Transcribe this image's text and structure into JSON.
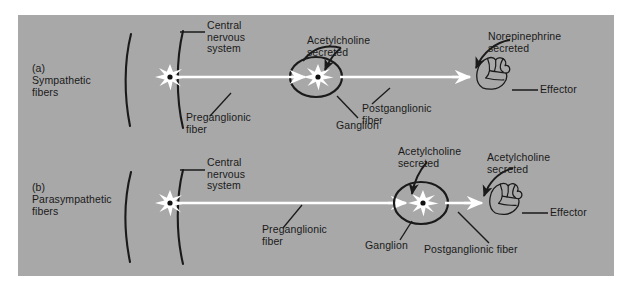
{
  "figure": {
    "background_color": "#ffffff",
    "panel_color": "#a8a8a8",
    "ink_color": "#1a1a1a",
    "fiber_color": "#ffffff"
  },
  "panels": [
    {
      "id": "a",
      "caption": "(a)\nSympathetic\nfibers",
      "caption_marker": "(a)",
      "caption_text": "Sympathetic\nfibers",
      "labels": {
        "cns": "Central\nnervous\nsystem",
        "preganglionic": "Preganglionic\nfiber",
        "ganglion": "Ganglion",
        "postganglionic": "Postganglionic\nfiber",
        "neurotransmitter_ganglion": "Acetylcholine\nsecreted",
        "neurotransmitter_effector": "Norepinephrine\nsecreted",
        "effector": "Effector"
      }
    },
    {
      "id": "b",
      "caption": "(b)\nParasympathetic\nfibers",
      "caption_marker": "(b)",
      "caption_text": "Parasympathetic\nfibers",
      "labels": {
        "cns": "Central\nnervous\nsystem",
        "preganglionic": "Preganglionic\nfiber",
        "ganglion": "Ganglion",
        "postganglionic": "Postganglionic fiber",
        "neurotransmitter_ganglion": "Acetylcholine\nsecreted",
        "neurotransmitter_effector": "Acetylcholine\nsecreted",
        "effector": "Effector"
      }
    }
  ]
}
